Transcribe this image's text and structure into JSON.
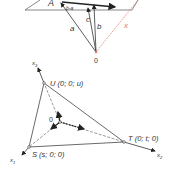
{
  "top_figure": {
    "point_A": "A",
    "vec_a": "a",
    "vec_b": "b",
    "vec_c": "c",
    "vec_b_minus_a": "b-a",
    "vec_x": "x",
    "origin": "0",
    "x_color": "#e07a6a"
  },
  "bottom_figure": {
    "axis_x1": "x",
    "axis_x1_sub": "1",
    "axis_x2": "x",
    "axis_x2_sub": "2",
    "axis_x3": "x",
    "axis_x3_sub": "3",
    "point_U": "U (0; 0; u)",
    "point_T": "T (0; t; 0)",
    "point_S": "S (s; 0; 0)",
    "origin": "0"
  }
}
